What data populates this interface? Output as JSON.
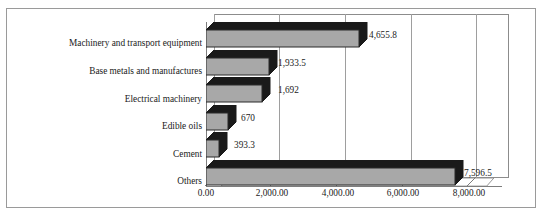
{
  "chart_data": {
    "type": "bar",
    "orientation": "horizontal",
    "title": "",
    "subtitle": "",
    "xlabel": "",
    "ylabel": "",
    "xlim": [
      0,
      9000
    ],
    "xticks": [
      "0.00",
      "2,000.00",
      "4,000.00",
      "6,000.00",
      "8,000.00"
    ],
    "xtick_values": [
      0,
      2000,
      4000,
      6000,
      8000
    ],
    "grid": true,
    "grid_axis": "x",
    "legend": false,
    "style": "3d-clustered-bar",
    "bar_fill_color": "#a8a8a8",
    "bar_edge_color": "#2b2b2b",
    "plot_background": "#ffffff",
    "categories": [
      "Machinery and transport equipment",
      "Base metals and manufactures",
      "Electrical machinery",
      "Edible oils",
      "Cement",
      "Others"
    ],
    "values": [
      4655.8,
      1933.5,
      1692,
      670,
      393.3,
      7596.5
    ],
    "data_labels": [
      "4,655.8",
      "1,933.5",
      "1,692",
      "670",
      "393.3",
      "7,596.5"
    ],
    "series": [
      {
        "name": "",
        "values": [
          4655.8,
          1933.5,
          1692,
          670,
          393.3,
          7596.5
        ]
      }
    ]
  }
}
